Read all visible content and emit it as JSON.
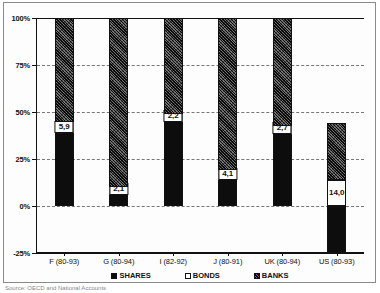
{
  "chart_data": {
    "type": "bar",
    "title": "",
    "subtitle": "",
    "xlabel": "",
    "ylabel": "",
    "stacked": true,
    "grid": true,
    "legend_position": "bottom",
    "ylim": [
      -25,
      100
    ],
    "yticks": [
      100,
      75,
      50,
      25,
      0,
      -25
    ],
    "ytick_labels": [
      "100%",
      "75%",
      "50%",
      "25%",
      "0%",
      "-25%"
    ],
    "categories": [
      "F (80-93)",
      "G (80-94)",
      "I (82-92)",
      "J (80-91)",
      "UK (80-94)",
      "US (80-93)"
    ],
    "series": [
      {
        "name": "SHARES",
        "values": [
          39.0,
          8.0,
          47.0,
          15.0,
          40.0,
          -25.0
        ]
      },
      {
        "name": "BONDS",
        "values": [
          5.9,
          2.1,
          2.2,
          4.1,
          2.7,
          14.0
        ]
      },
      {
        "name": "BANKS",
        "values": [
          55.1,
          89.9,
          50.8,
          80.9,
          57.3,
          30.0
        ]
      }
    ],
    "bar_labels": [
      {
        "category": "F (80-93)",
        "series": "BONDS",
        "text": "5,9"
      },
      {
        "category": "G (80-94)",
        "series": "BONDS",
        "text": "2,1"
      },
      {
        "category": "I (82-92)",
        "series": "BONDS",
        "text": "2,2"
      },
      {
        "category": "J (80-91)",
        "series": "BONDS",
        "text": "4,1"
      },
      {
        "category": "UK (80-94)",
        "series": "BONDS",
        "text": "2,7"
      },
      {
        "category": "US (80-93)",
        "series": "BONDS",
        "text": "14,0"
      }
    ],
    "colors": {
      "shares": "#0d0d0d",
      "bonds": "#ffffff",
      "banks": "#4d4d4d",
      "axis": "#111111",
      "grid": "#777777"
    }
  },
  "legend": {
    "items": [
      {
        "label": "SHARES"
      },
      {
        "label": "BONDS"
      },
      {
        "label": "BANKS"
      }
    ]
  },
  "source_note": "Source: OECD and National Accounts"
}
